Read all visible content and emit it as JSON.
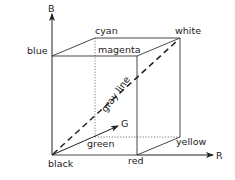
{
  "diagram": {
    "axes": {
      "b": {
        "label": "B"
      },
      "g": {
        "label": "G"
      },
      "r": {
        "label": "R"
      }
    },
    "vertices": {
      "black": {
        "label": "black"
      },
      "red": {
        "label": "red"
      },
      "green": {
        "label": "green"
      },
      "blue": {
        "label": "blue"
      },
      "cyan": {
        "label": "cyan"
      },
      "magenta": {
        "label": "magenta"
      },
      "yellow": {
        "label": "yellow"
      },
      "white": {
        "label": "white"
      }
    },
    "diagonal": {
      "label": "gray line"
    },
    "colors": {
      "stroke": "#333333",
      "text": "#222222",
      "background": "#ffffff"
    }
  }
}
